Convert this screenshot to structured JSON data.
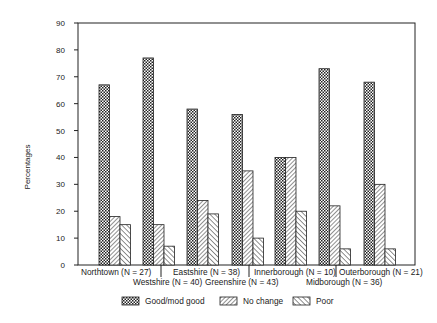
{
  "chart_data": {
    "type": "bar",
    "title": "",
    "xlabel": "",
    "ylabel": "Percentages",
    "ylim": [
      0,
      90
    ],
    "yticks": [
      0,
      10,
      20,
      30,
      40,
      50,
      60,
      70,
      80,
      90
    ],
    "grid": false,
    "legend_position": "bottom",
    "categories": [
      "Northtown (N = 27)",
      "Westshire (N = 40)",
      "Eastshire (N = 38)",
      "Greenshire (N = 43)",
      "Innerborough (N = 10)",
      "Midborough (N = 36)",
      "Outerborough (N = 21)"
    ],
    "series": [
      {
        "name": "Good/mod good",
        "pattern": "checker",
        "values": [
          67,
          77,
          58,
          56,
          40,
          73,
          68
        ]
      },
      {
        "name": "No change",
        "pattern": "hatch-back",
        "values": [
          18,
          15,
          24,
          35,
          40,
          22,
          30
        ]
      },
      {
        "name": "Poor",
        "pattern": "hatch-forward",
        "values": [
          15,
          7,
          19,
          10,
          20,
          6,
          6
        ]
      }
    ]
  },
  "legend": {
    "good": "Good/mod good",
    "nochange": "No change",
    "poor": "Poor"
  }
}
